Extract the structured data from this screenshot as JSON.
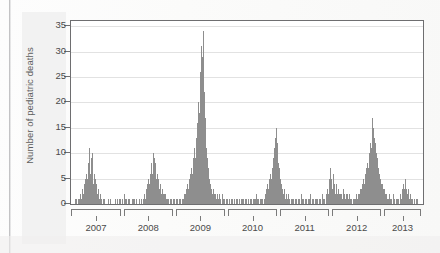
{
  "figure": {
    "ylabel": "Number of pediatric deaths"
  },
  "chart_data": {
    "type": "bar",
    "title": "",
    "xlabel": "",
    "ylabel": "Number of pediatric deaths",
    "ylim": [
      0,
      36
    ],
    "yticks": [
      0,
      5,
      10,
      15,
      20,
      25,
      30,
      35
    ],
    "ytick_labels": [
      "0",
      "5",
      "10",
      "15",
      "20",
      "25",
      "30",
      "35"
    ],
    "xtick_labels": [
      "2007",
      "2008",
      "2009",
      "2010",
      "2011",
      "2012",
      "2013"
    ],
    "x_unit": "week",
    "grid": true,
    "legend": null,
    "bar_color": "#8e8e8e",
    "series_name": "Weekly pediatric influenza-associated deaths",
    "annotations": [
      {
        "label": "2009 H1N1 pandemic peak",
        "value": 34
      },
      {
        "label": "2010-11 season peak",
        "value": 15
      },
      {
        "label": "2012-13 season peak",
        "value": 17
      }
    ],
    "season_brackets": [
      {
        "label": "2007",
        "start_frac": 0.003,
        "end_frac": 0.145
      },
      {
        "label": "2008",
        "start_frac": 0.152,
        "end_frac": 0.293
      },
      {
        "label": "2009",
        "start_frac": 0.3,
        "end_frac": 0.441
      },
      {
        "label": "2010",
        "start_frac": 0.448,
        "end_frac": 0.589
      },
      {
        "label": "2011",
        "start_frac": 0.596,
        "end_frac": 0.737
      },
      {
        "label": "2012",
        "start_frac": 0.744,
        "end_frac": 0.885
      },
      {
        "label": "2013",
        "start_frac": 0.892,
        "end_frac": 0.997
      }
    ],
    "values": [
      0,
      0,
      0,
      0,
      0,
      1,
      0,
      1,
      0,
      0,
      1,
      0,
      1,
      2,
      1,
      2,
      3,
      2,
      4,
      3,
      5,
      4,
      6,
      5,
      8,
      7,
      11,
      6,
      9,
      5,
      10,
      4,
      6,
      3,
      5,
      4,
      3,
      2,
      3,
      2,
      1,
      2,
      1,
      1,
      0,
      1,
      0,
      1,
      0,
      0,
      0,
      0,
      1,
      0,
      0,
      0,
      1,
      0,
      0,
      0,
      0,
      0,
      1,
      0,
      0,
      1,
      0,
      0,
      1,
      0,
      1,
      0,
      0,
      1,
      0,
      2,
      1,
      0,
      1,
      0,
      0,
      1,
      0,
      1,
      0,
      0,
      1,
      0,
      1,
      0,
      1,
      0,
      0,
      1,
      0,
      0,
      1,
      0,
      0,
      0,
      1,
      0,
      1,
      0,
      2,
      1,
      3,
      2,
      4,
      3,
      5,
      4,
      6,
      5,
      8,
      6,
      10,
      7,
      9,
      6,
      8,
      5,
      6,
      4,
      5,
      3,
      4,
      3,
      2,
      3,
      2,
      1,
      2,
      1,
      2,
      1,
      1,
      0,
      1,
      0,
      1,
      0,
      1,
      0,
      0,
      1,
      0,
      1,
      0,
      1,
      0,
      1,
      0,
      1,
      0,
      1,
      0,
      1,
      0,
      1,
      2,
      1,
      2,
      3,
      2,
      4,
      3,
      5,
      4,
      6,
      5,
      7,
      6,
      9,
      7,
      11,
      9,
      13,
      11,
      16,
      14,
      20,
      18,
      26,
      24,
      31,
      29,
      34,
      27,
      22,
      17,
      14,
      11,
      9,
      7,
      6,
      5,
      4,
      3,
      3,
      2,
      3,
      2,
      2,
      1,
      2,
      1,
      2,
      1,
      1,
      2,
      1,
      1,
      0,
      1,
      2,
      1,
      0,
      1,
      0,
      1,
      0,
      1,
      0,
      1,
      0,
      0,
      1,
      0,
      1,
      0,
      1,
      0,
      0,
      1,
      0,
      1,
      0,
      1,
      0,
      0,
      1,
      0,
      1,
      0,
      1,
      0,
      1,
      0,
      1,
      0,
      1,
      0,
      0,
      1,
      0,
      1,
      0,
      1,
      0,
      1,
      0,
      1,
      2,
      1,
      0,
      1,
      0,
      1,
      0,
      1,
      0,
      1,
      0,
      1,
      2,
      1,
      3,
      2,
      4,
      3,
      5,
      4,
      6,
      5,
      7,
      6,
      9,
      8,
      11,
      13,
      15,
      12,
      10,
      8,
      7,
      6,
      5,
      4,
      3,
      3,
      2,
      3,
      2,
      1,
      2,
      1,
      1,
      2,
      1,
      1,
      0,
      1,
      0,
      1,
      0,
      1,
      0,
      1,
      0,
      1,
      0,
      1,
      0,
      1,
      0,
      1,
      2,
      1,
      0,
      1,
      0,
      1,
      0,
      1,
      0,
      1,
      0,
      1,
      2,
      1,
      0,
      1,
      0,
      1,
      0,
      1,
      0,
      1,
      0,
      1,
      0,
      1,
      0,
      1,
      0,
      1,
      2,
      1,
      0,
      1,
      0,
      2,
      1,
      3,
      2,
      5,
      3,
      7,
      5,
      4,
      3,
      6,
      4,
      3,
      2,
      4,
      3,
      2,
      3,
      2,
      1,
      2,
      1,
      2,
      1,
      2,
      3,
      2,
      1,
      2,
      1,
      2,
      1,
      1,
      2,
      1,
      0,
      1,
      0,
      1,
      0,
      1,
      0,
      1,
      2,
      1,
      2,
      1,
      2,
      3,
      2,
      3,
      4,
      3,
      5,
      4,
      6,
      5,
      7,
      6,
      8,
      7,
      10,
      9,
      12,
      11,
      14,
      17,
      15,
      13,
      11,
      12,
      10,
      9,
      8,
      7,
      6,
      5,
      5,
      4,
      3,
      4,
      3,
      2,
      3,
      2,
      1,
      2,
      1,
      1,
      2,
      1,
      1,
      0,
      1,
      0,
      1,
      2,
      1,
      0,
      1,
      0,
      1,
      0,
      1,
      0,
      1,
      2,
      1,
      3,
      2,
      4,
      3,
      5,
      4,
      3,
      2,
      3,
      2,
      1,
      2,
      1,
      1,
      0,
      1,
      0,
      1,
      0,
      0,
      1,
      0,
      1,
      0,
      0,
      0,
      0,
      0,
      0,
      0
    ]
  }
}
